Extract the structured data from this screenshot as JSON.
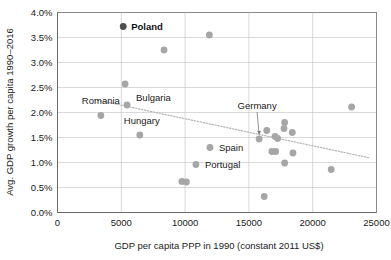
{
  "chart_data": {
    "type": "scatter",
    "title": "",
    "xlabel": "GDP per capita PPP in 1990 (constant 2011 US$)",
    "ylabel": "Avg. GDP growth per capita 1990–2016",
    "xlim": [
      0,
      25000
    ],
    "ylim": [
      0,
      4.0
    ],
    "grid": true,
    "legend": "none",
    "x_ticks": [
      "0",
      "5000",
      "10000",
      "15000",
      "20000",
      "25000"
    ],
    "x_tick_values": [
      0,
      5000,
      10000,
      15000,
      20000,
      25000
    ],
    "y_ticks": [
      "0.0%",
      "0.5%",
      "1.0%",
      "1.5%",
      "2.0%",
      "2.5%",
      "3.0%",
      "3.5%",
      "4.0%"
    ],
    "y_tick_values": [
      0.0,
      0.5,
      1.0,
      1.5,
      2.0,
      2.5,
      3.0,
      3.5,
      4.0
    ],
    "points": [
      {
        "x": 5150,
        "y": 3.72,
        "label": "Poland",
        "highlight": true,
        "label_dx": 8,
        "label_dy": 3.2,
        "anchor": "start"
      },
      {
        "x": 11900,
        "y": 3.55,
        "label": "",
        "highlight": false
      },
      {
        "x": 8350,
        "y": 3.25,
        "label": "",
        "highlight": false
      },
      {
        "x": 5300,
        "y": 2.57,
        "label": "",
        "highlight": false
      },
      {
        "x": 5450,
        "y": 2.15,
        "label": "Bulgaria",
        "highlight": false,
        "label_dx": 9,
        "label_dy": -4,
        "anchor": "start"
      },
      {
        "x": 3400,
        "y": 1.94,
        "label": "Romania",
        "highlight": false,
        "label_dx": 0,
        "label_dy": -12,
        "anchor": "middle"
      },
      {
        "x": 6450,
        "y": 1.55,
        "label": "Hungary",
        "highlight": false,
        "label_dx": 2,
        "label_dy": -11,
        "anchor": "middle"
      },
      {
        "x": 23050,
        "y": 2.11,
        "label": "",
        "highlight": false
      },
      {
        "x": 17800,
        "y": 1.8,
        "label": "",
        "highlight": false
      },
      {
        "x": 16400,
        "y": 1.64,
        "label": "",
        "highlight": false
      },
      {
        "x": 17750,
        "y": 1.68,
        "label": "",
        "highlight": false
      },
      {
        "x": 18400,
        "y": 1.6,
        "label": "",
        "highlight": false
      },
      {
        "x": 17050,
        "y": 1.52,
        "label": "",
        "highlight": false
      },
      {
        "x": 17250,
        "y": 1.48,
        "label": "",
        "highlight": false
      },
      {
        "x": 15800,
        "y": 1.47,
        "label": "Germany",
        "highlight": false,
        "leader": true,
        "label_dx": -2,
        "label_dy": -30,
        "anchor": "middle"
      },
      {
        "x": 16800,
        "y": 1.22,
        "label": "",
        "highlight": false
      },
      {
        "x": 17100,
        "y": 1.22,
        "label": "",
        "highlight": false
      },
      {
        "x": 18450,
        "y": 1.19,
        "label": "",
        "highlight": false
      },
      {
        "x": 17800,
        "y": 0.99,
        "label": "",
        "highlight": false
      },
      {
        "x": 21450,
        "y": 0.86,
        "label": "",
        "highlight": false
      },
      {
        "x": 16200,
        "y": 0.32,
        "label": "",
        "highlight": false
      },
      {
        "x": 11950,
        "y": 1.3,
        "label": "Spain",
        "highlight": false,
        "label_dx": 9,
        "label_dy": 3.2,
        "anchor": "start"
      },
      {
        "x": 10850,
        "y": 0.96,
        "label": "Portugal",
        "highlight": false,
        "label_dx": 9,
        "label_dy": 3.2,
        "anchor": "start"
      },
      {
        "x": 9750,
        "y": 0.62,
        "label": "",
        "highlight": false
      },
      {
        "x": 10100,
        "y": 0.61,
        "label": "",
        "highlight": false
      }
    ],
    "trendline": {
      "visible": true,
      "style": "dotted",
      "x_start": 2900,
      "y_start": 2.26,
      "x_end": 24500,
      "y_end": 1.09
    }
  }
}
